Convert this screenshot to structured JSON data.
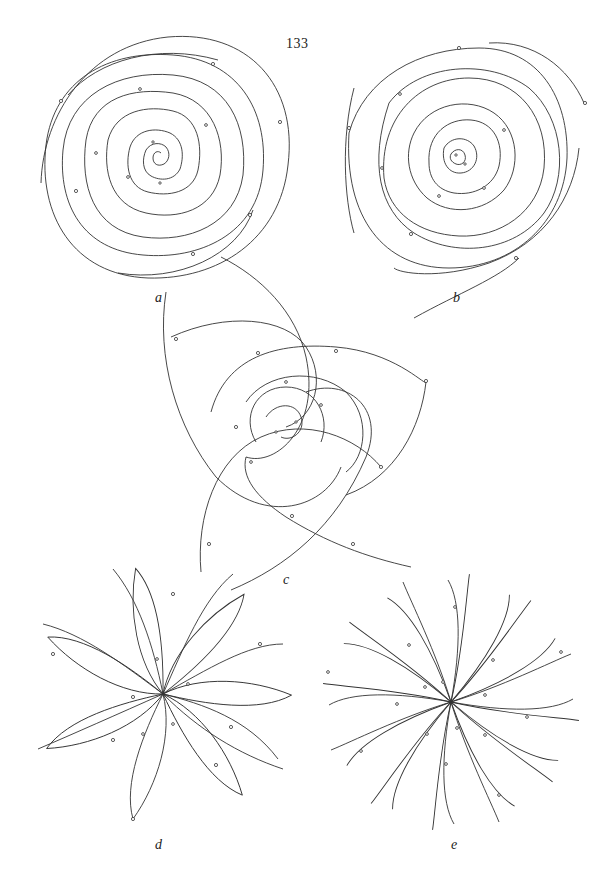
{
  "page": {
    "number": "133"
  },
  "figures": [
    {
      "id": "a",
      "label": "a",
      "type": "concentric-spiral",
      "center": [
        158,
        155
      ],
      "label_pos": [
        155,
        298
      ]
    },
    {
      "id": "b",
      "label": "b",
      "type": "rotating-loop-spiral",
      "center": [
        459,
        158
      ],
      "label_pos": [
        453,
        298
      ]
    },
    {
      "id": "c",
      "label": "c",
      "type": "three-arm-spiral",
      "center": [
        286,
        427
      ],
      "label_pos": [
        283,
        580
      ]
    },
    {
      "id": "d",
      "label": "d",
      "type": "seven-petal-rosette",
      "center": [
        163,
        694
      ],
      "label_pos": [
        155,
        845
      ]
    },
    {
      "id": "e",
      "label": "e",
      "type": "twelve-petal-rosette",
      "center": [
        451,
        702
      ],
      "label_pos": [
        451,
        845
      ]
    }
  ],
  "colors": {
    "background": "#ffffff",
    "ink": "#333333"
  }
}
